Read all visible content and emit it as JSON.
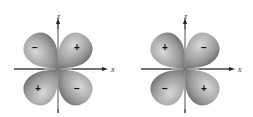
{
  "diagrams": [
    {
      "name": "orbital-left",
      "axis_labels": {
        "vertical": "z",
        "horizontal": "x"
      },
      "lobes": {
        "upper_left": "−",
        "upper_right": "+",
        "lower_left": "+",
        "lower_right": "−"
      }
    },
    {
      "name": "orbital-right",
      "axis_labels": {
        "vertical": "z",
        "horizontal": "x"
      },
      "lobes": {
        "upper_left": "+",
        "upper_right": "−",
        "lower_left": "−",
        "lower_right": "+"
      }
    }
  ],
  "colors": {
    "lobe_light": "#d4d4d4",
    "lobe_dark": "#6e6e6e",
    "axis": "#222222"
  }
}
